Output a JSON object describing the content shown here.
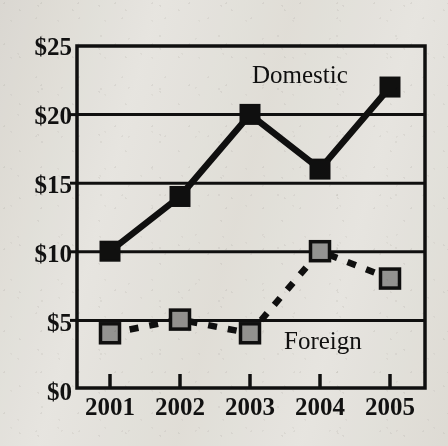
{
  "chart_data": {
    "type": "line",
    "title": "",
    "xlabel": "",
    "ylabel": "",
    "categories": [
      "2001",
      "2002",
      "2003",
      "2004",
      "2005"
    ],
    "x_tick_labels": [
      "2001",
      "2002",
      "2003",
      "2004",
      "2005"
    ],
    "y_tick_labels": [
      "$0",
      "$5",
      "$10",
      "$15",
      "$20",
      "$25"
    ],
    "y_tick_values": [
      0,
      5,
      10,
      15,
      20,
      25
    ],
    "ylim": [
      0,
      25
    ],
    "grid": "horizontal",
    "legend_position": "inline-annotation",
    "series": [
      {
        "name": "Domestic",
        "values": [
          10,
          14,
          20,
          16,
          22
        ],
        "line_style": "solid",
        "marker": "square-filled",
        "marker_fill": "#101010",
        "line_color": "#101010"
      },
      {
        "name": "Foreign",
        "values": [
          4,
          5,
          4,
          10,
          8
        ],
        "line_style": "dashed",
        "marker": "square-filled",
        "marker_fill": "#9c9c9c",
        "line_color": "#101010"
      }
    ],
    "annotations": [
      {
        "text": "Domestic",
        "series": "Domestic"
      },
      {
        "text": "Foreign",
        "series": "Foreign"
      }
    ]
  },
  "axes": {
    "y_labels": [
      "$25",
      "$20",
      "$15",
      "$10",
      "$5",
      "$0"
    ],
    "x_labels": [
      "2001",
      "2002",
      "2003",
      "2004",
      "2005"
    ]
  },
  "labels": {
    "domestic": "Domestic",
    "foreign": "Foreign"
  },
  "title_ghost": "........ ... .. ....... ...",
  "colors": {
    "ink": "#101010",
    "foreign_marker": "#9c9c9c",
    "paper": "#f3f2ef"
  }
}
